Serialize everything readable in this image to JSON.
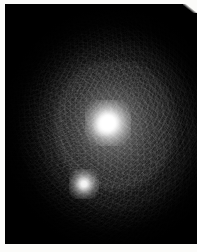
{
  "image": {
    "kind": "grayscale-astronomical-frame",
    "width_px": 197,
    "height_px": 252,
    "background_color": "#030303",
    "border_color": "#fbfbf9",
    "alt_text": "Dark grayscale astronomical image showing a bright saturated point source near the centre with a fainter companion source below-left, surrounded by a diffuse mottled halo on a near-black background."
  },
  "frame": {
    "left_px": 5,
    "top_px": 4,
    "width_px": 192,
    "height_px": 240,
    "border_label": "white paper margin"
  },
  "chart_data": {
    "type": "heatmap",
    "title": "",
    "xlabel": "",
    "ylabel": "",
    "colormap": "grayscale",
    "value_range": [
      0,
      255
    ],
    "background_level": 3,
    "sources": [
      {
        "name": "primary-source",
        "x_px": 108,
        "y_px": 123,
        "peak_value": 255,
        "fwhm_px": 17,
        "saturated": true,
        "color": "#ffffff"
      },
      {
        "name": "secondary-source",
        "x_px": 84,
        "y_px": 184,
        "peak_value": 238,
        "fwhm_px": 9,
        "saturated": false,
        "color": "#f4f4f4"
      }
    ],
    "halo": {
      "name": "diffuse-halo",
      "center_x_px": 108,
      "center_y_px": 128,
      "semi_major_px": 112,
      "semi_minor_px": 122,
      "mean_value": 42,
      "color": "#464646"
    },
    "grid": false,
    "legend": "none"
  },
  "annotations": [],
  "labels": {
    "primary": "",
    "secondary": "",
    "scale_bar": ""
  }
}
